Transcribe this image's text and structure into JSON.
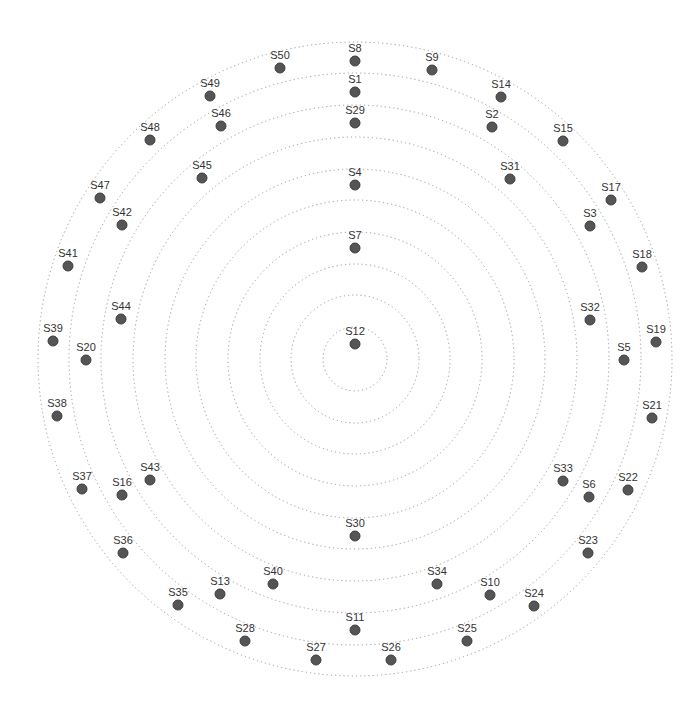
{
  "diagram": {
    "type": "concentric-ring-node-layout",
    "center": {
      "x": 355,
      "y": 359
    },
    "ring_radii": [
      32,
      64,
      95,
      127,
      159,
      190,
      222,
      254,
      286,
      317
    ],
    "colors": {
      "ring": "#9a9a9a",
      "node_fill": "#555555",
      "node_stroke": "#3e3e3e",
      "label": "#333333"
    },
    "nodes": [
      {
        "id": "S1",
        "x": 355,
        "y": 92
      },
      {
        "id": "S2",
        "x": 492,
        "y": 127
      },
      {
        "id": "S3",
        "x": 590,
        "y": 226
      },
      {
        "id": "S4",
        "x": 355,
        "y": 185
      },
      {
        "id": "S5",
        "x": 624,
        "y": 360
      },
      {
        "id": "S6",
        "x": 589,
        "y": 497
      },
      {
        "id": "S7",
        "x": 355,
        "y": 248
      },
      {
        "id": "S8",
        "x": 355,
        "y": 61
      },
      {
        "id": "S9",
        "x": 432,
        "y": 70
      },
      {
        "id": "S10",
        "x": 490,
        "y": 595
      },
      {
        "id": "S11",
        "x": 355,
        "y": 630
      },
      {
        "id": "S12",
        "x": 355,
        "y": 344
      },
      {
        "id": "S13",
        "x": 220,
        "y": 594
      },
      {
        "id": "S14",
        "x": 501,
        "y": 97
      },
      {
        "id": "S15",
        "x": 563,
        "y": 141
      },
      {
        "id": "S16",
        "x": 122,
        "y": 495
      },
      {
        "id": "S17",
        "x": 611,
        "y": 200
      },
      {
        "id": "S18",
        "x": 642,
        "y": 267
      },
      {
        "id": "S19",
        "x": 656,
        "y": 342
      },
      {
        "id": "S20",
        "x": 86,
        "y": 360
      },
      {
        "id": "S21",
        "x": 652,
        "y": 418
      },
      {
        "id": "S22",
        "x": 628,
        "y": 490
      },
      {
        "id": "S23",
        "x": 588,
        "y": 553
      },
      {
        "id": "S24",
        "x": 534,
        "y": 606
      },
      {
        "id": "S25",
        "x": 467,
        "y": 641
      },
      {
        "id": "S26",
        "x": 391,
        "y": 660
      },
      {
        "id": "S27",
        "x": 316,
        "y": 660
      },
      {
        "id": "S28",
        "x": 245,
        "y": 641
      },
      {
        "id": "S29",
        "x": 355,
        "y": 123
      },
      {
        "id": "S30",
        "x": 355,
        "y": 536
      },
      {
        "id": "S31",
        "x": 510,
        "y": 179
      },
      {
        "id": "S32",
        "x": 590,
        "y": 320
      },
      {
        "id": "S33",
        "x": 563,
        "y": 481
      },
      {
        "id": "S34",
        "x": 437,
        "y": 584
      },
      {
        "id": "S35",
        "x": 178,
        "y": 605
      },
      {
        "id": "S36",
        "x": 123,
        "y": 553
      },
      {
        "id": "S37",
        "x": 82,
        "y": 489
      },
      {
        "id": "S38",
        "x": 57,
        "y": 416
      },
      {
        "id": "S39",
        "x": 53,
        "y": 341
      },
      {
        "id": "S40",
        "x": 273,
        "y": 584
      },
      {
        "id": "S41",
        "x": 68,
        "y": 266
      },
      {
        "id": "S42",
        "x": 122,
        "y": 225
      },
      {
        "id": "S43",
        "x": 150,
        "y": 480
      },
      {
        "id": "S44",
        "x": 121,
        "y": 319
      },
      {
        "id": "S45",
        "x": 202,
        "y": 178
      },
      {
        "id": "S46",
        "x": 221,
        "y": 126
      },
      {
        "id": "S47",
        "x": 100,
        "y": 198
      },
      {
        "id": "S48",
        "x": 150,
        "y": 140
      },
      {
        "id": "S49",
        "x": 210,
        "y": 96
      },
      {
        "id": "S50",
        "x": 280,
        "y": 68
      }
    ]
  }
}
